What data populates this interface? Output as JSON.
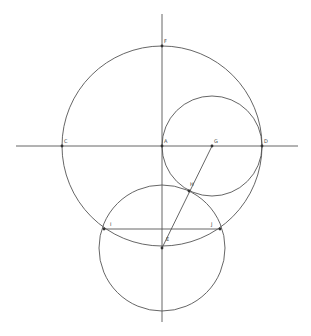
{
  "diagram": {
    "stroke_color": "#555555",
    "background": "#ffffff",
    "lines": {
      "horizontal_axis": {
        "x1": 16,
        "y1": 146,
        "x2": 298,
        "y2": 146
      },
      "vertical_axis": {
        "x1": 162,
        "y1": 14,
        "x2": 162,
        "y2": 322
      },
      "segment_GE": {
        "x1": 212,
        "y1": 146,
        "x2": 162,
        "y2": 248
      },
      "chord_IJ": {
        "x1": 104,
        "y1": 229,
        "x2": 220,
        "y2": 229
      }
    },
    "circles": {
      "large": {
        "cx": 162,
        "cy": 146,
        "r": 100
      },
      "small": {
        "cx": 212,
        "cy": 146,
        "r": 50
      },
      "lower": {
        "cx": 162,
        "cy": 248,
        "r": 63
      }
    },
    "points": [
      {
        "label": "F",
        "x": 162,
        "y": 46,
        "lx": 164,
        "ly": 43
      },
      {
        "label": "C",
        "x": 62,
        "y": 146,
        "lx": 64,
        "ly": 143
      },
      {
        "label": "A",
        "x": 162,
        "y": 146,
        "lx": 164,
        "ly": 143
      },
      {
        "label": "G",
        "x": 212,
        "y": 146,
        "lx": 214,
        "ly": 143
      },
      {
        "label": "D",
        "x": 262,
        "y": 146,
        "lx": 264,
        "ly": 143
      },
      {
        "label": "H",
        "x": 189,
        "y": 191,
        "lx": 190,
        "ly": 186
      },
      {
        "label": "I",
        "x": 104,
        "y": 229,
        "lx": 110,
        "ly": 226
      },
      {
        "label": "J",
        "x": 220,
        "y": 229,
        "lx": 211,
        "ly": 226
      },
      {
        "label": "E",
        "x": 162,
        "y": 248,
        "lx": 166,
        "ly": 241
      }
    ]
  }
}
